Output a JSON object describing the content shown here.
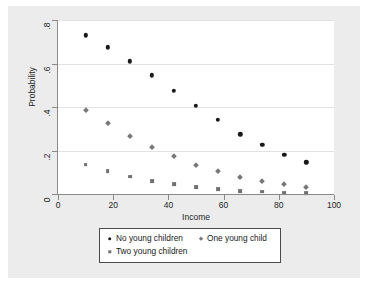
{
  "chart_data": {
    "type": "scatter",
    "title": "",
    "xlabel": "Income",
    "ylabel": "Probability",
    "xlim": [
      0,
      100
    ],
    "ylim": [
      0,
      0.8
    ],
    "grid": true,
    "legend_position": "bottom",
    "x_ticks": [
      "0",
      "20",
      "40",
      "60",
      "80",
      "100"
    ],
    "x_tick_values": [
      0,
      20,
      40,
      60,
      80,
      100
    ],
    "y_ticks": [
      "0",
      ".2",
      ".4",
      ".6",
      ".8"
    ],
    "y_tick_values": [
      0,
      0.2,
      0.4,
      0.6,
      0.8
    ],
    "x": [
      10,
      18,
      26,
      34,
      42,
      50,
      58,
      66,
      74,
      82,
      90
    ],
    "series": [
      {
        "name": "No young children",
        "marker": "circle",
        "color": "#1a1a1a",
        "values": [
          0.73,
          0.675,
          0.61,
          0.545,
          0.475,
          0.405,
          0.34,
          0.275,
          0.225,
          0.18,
          0.145
        ]
      },
      {
        "name": "One young child",
        "marker": "diamond",
        "color": "#777777",
        "values": [
          0.385,
          0.325,
          0.265,
          0.215,
          0.175,
          0.135,
          0.105,
          0.08,
          0.06,
          0.045,
          0.03
        ]
      },
      {
        "name": "Two young children",
        "marker": "square",
        "color": "#707070",
        "values": [
          0.135,
          0.105,
          0.08,
          0.06,
          0.045,
          0.032,
          0.023,
          0.015,
          0.011,
          0.006,
          0.004
        ]
      }
    ]
  },
  "legend": {
    "entries": [
      {
        "label": "No young children",
        "icon": "circle-marker-icon"
      },
      {
        "label": "One young child",
        "icon": "diamond-marker-icon"
      },
      {
        "label": "Two young children",
        "icon": "square-marker-icon"
      }
    ]
  }
}
